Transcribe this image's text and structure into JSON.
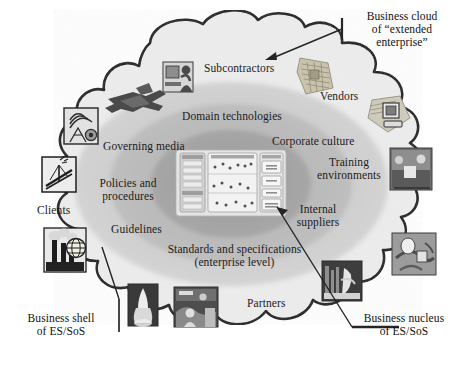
{
  "figure": {
    "type": "concentric-venn-cloud-diagram",
    "title_absent": true,
    "background": "#ffffff",
    "palette": {
      "cloud_outline": "#111111",
      "cloud_fill": "#ebebeb",
      "outer_ellipse": "#d0d0d0",
      "mid_ellipse": "#b9b9b9",
      "inner_ellipse": "#a3a3a3",
      "nucleus_panel": "#dedede",
      "text": "#1b1b1b",
      "leader_line": "#2a2a2a"
    }
  },
  "outside_labels": [
    {
      "id": "business-cloud",
      "line1": "Business cloud",
      "line2": "of “extended enterprise”"
    },
    {
      "id": "business-shell",
      "line1": "Business shell",
      "line2": "of ES/SoS"
    },
    {
      "id": "business-nucleus",
      "line1": "Business nucleus",
      "line2": "of ES/SoS"
    }
  ],
  "cloud_layer_labels": [
    {
      "id": "subcontractors",
      "text": "Subcontractors"
    },
    {
      "id": "vendors",
      "text": "Vendors"
    },
    {
      "id": "clients",
      "text": "Clients"
    },
    {
      "id": "partners",
      "text": "Partners"
    }
  ],
  "shell_layer_labels": [
    {
      "id": "domain-technologies",
      "text": "Domain technologies"
    },
    {
      "id": "corporate-culture",
      "text": "Corporate culture"
    },
    {
      "id": "governing-media",
      "text": "Governing media"
    },
    {
      "id": "training-env-l1",
      "text": "Training"
    },
    {
      "id": "training-env-l2",
      "text": "environments"
    },
    {
      "id": "policies-l1",
      "text": "Policies and"
    },
    {
      "id": "policies-l2",
      "text": "procedures"
    },
    {
      "id": "guidelines",
      "text": "Guidelines"
    },
    {
      "id": "internal-sup-l1",
      "text": "Internal"
    },
    {
      "id": "internal-sup-l2",
      "text": "suppliers"
    },
    {
      "id": "standards-l1",
      "text": "Standards and specifications"
    },
    {
      "id": "standards-l2",
      "text": "(enterprise level)"
    }
  ],
  "icons": [
    {
      "id": "fighter-jet-icon",
      "name": "fighter-jet-icon"
    },
    {
      "id": "person-computer-icon",
      "name": "person-at-computer-icon"
    },
    {
      "id": "circuit-board-icon",
      "name": "circuit-board-icon"
    },
    {
      "id": "antenna-radar-icon",
      "name": "antenna-radar-icon"
    },
    {
      "id": "workstation-icon",
      "name": "computer-workstation-icon"
    },
    {
      "id": "bridge-crane-icon",
      "name": "bridge-construction-icon"
    },
    {
      "id": "factory-globe-icon",
      "name": "factory-globe-icon"
    },
    {
      "id": "lab-people-icon",
      "name": "laboratory-people-photo-icon"
    },
    {
      "id": "space-shuttle-icon",
      "name": "space-shuttle-launch-icon"
    },
    {
      "id": "team-photo-icon",
      "name": "team-photo-icon"
    },
    {
      "id": "machinery-icon",
      "name": "industrial-machinery-photo-icon"
    },
    {
      "id": "pipeline-icon",
      "name": "pipeline-valve-photo-icon"
    }
  ],
  "nucleus_thumbnail": {
    "name": "enterprise-architecture-thumbnail",
    "panels": [
      {
        "id": "left-panel",
        "caption": "Enterprise 1 (N)"
      },
      {
        "id": "center-panel",
        "caption": "Enterprise 2 (N)"
      },
      {
        "id": "right-panel",
        "caption": "Enterprise 3 (N)"
      }
    ],
    "right_panel_boxes": [
      "N1",
      "N2",
      "N3",
      "Synthesis /\nIntegration"
    ],
    "scatter_rows": 3
  },
  "leader_lines": [
    {
      "id": "cloud-leader",
      "from": "business-cloud",
      "to": "cloud-boundary"
    },
    {
      "id": "shell-leader",
      "from": "business-shell",
      "to": "shell-boundary"
    },
    {
      "id": "nucleus-leader",
      "from": "business-nucleus",
      "to": "nucleus-thumbnail"
    }
  ]
}
